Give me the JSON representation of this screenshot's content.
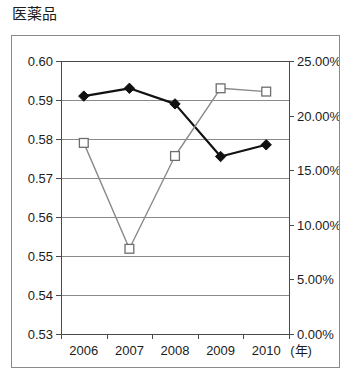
{
  "chart_data": {
    "type": "line",
    "title": "医薬品",
    "xlabel": "(年)",
    "ylabel": "",
    "categories": [
      "2006",
      "2007",
      "2008",
      "2009",
      "2010"
    ],
    "x_axis_unit_label": "(年)",
    "grid": true,
    "legend_position": "none",
    "axes": {
      "left": {
        "ylim": [
          0.53,
          0.6
        ],
        "tick_step": 0.01,
        "tick_labels": [
          "0.60",
          "0.59",
          "0.58",
          "0.57",
          "0.56",
          "0.55",
          "0.54",
          "0.53"
        ],
        "tick_values": [
          0.6,
          0.59,
          0.58,
          0.57,
          0.56,
          0.55,
          0.54,
          0.53
        ]
      },
      "right": {
        "ylim": [
          0.0,
          25.0
        ],
        "tick_step": 5.0,
        "tick_labels": [
          "25.00%",
          "20.00%",
          "15.00%",
          "10.00%",
          "5.00%",
          "0.00%"
        ],
        "tick_values": [
          25.0,
          20.0,
          15.0,
          10.0,
          5.0,
          0.0
        ]
      }
    },
    "series": [
      {
        "name": "diamond-series",
        "axis": "left",
        "marker": "filled-diamond",
        "color": "#111111",
        "values": [
          0.591,
          0.593,
          0.589,
          0.5755,
          0.5785
        ]
      },
      {
        "name": "square-series",
        "axis": "right",
        "marker": "open-square",
        "color": "#8a8a8a",
        "values": [
          17.5,
          7.8,
          16.3,
          22.5,
          22.2
        ]
      }
    ]
  }
}
